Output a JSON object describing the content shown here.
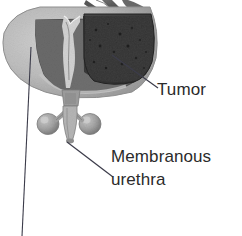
{
  "figure": {
    "kind": "anatomical-illustration",
    "background_color": "#ffffff",
    "width": 242,
    "height": 236
  },
  "labels": {
    "tumor": "Tumor",
    "membranous_line1": "Membranous",
    "membranous_line2": "urethra"
  },
  "colors": {
    "text": "#2b2b2b",
    "leader_line": "#3c3c4a",
    "gland_light": "#c0c0c0",
    "gland_mid": "#9a9a9a",
    "gland_shadow": "#787878",
    "tumor_dark": "#3a3a3a",
    "tumor_darker": "#262626",
    "urethra_light": "#d8d8d8",
    "capsule_outline": "#6e6e6e",
    "bulb_gland": "#a5a5a5"
  },
  "leader_lines": {
    "tumor": {
      "x1": 112,
      "y1": 55,
      "x2": 158,
      "y2": 88
    },
    "membranous_urethra": {
      "x1": 67,
      "y1": 142,
      "x2": 113,
      "y2": 177
    },
    "unlabeled_left": {
      "x1": 31,
      "y1": 47,
      "x2": 22,
      "y2": 236
    }
  },
  "structures": [
    {
      "name": "seminal-vesicles",
      "shade": "mid-gray"
    },
    {
      "name": "prostate-body-left",
      "shade": "light-gray"
    },
    {
      "name": "prostatic-urethra",
      "shade": "light"
    },
    {
      "name": "tumor-mass",
      "shade": "dark-mottled"
    },
    {
      "name": "bulbourethral-gland-left",
      "shade": "mid-gray"
    },
    {
      "name": "bulbourethral-gland-right",
      "shade": "mid-gray"
    },
    {
      "name": "membranous-urethra",
      "shade": "light-gray"
    }
  ]
}
